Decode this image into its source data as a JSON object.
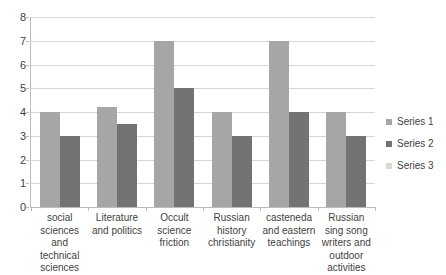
{
  "chart_data": {
    "type": "bar",
    "title": "",
    "subtitle": "",
    "xlabel": "",
    "ylabel": "",
    "ylim": [
      0,
      8
    ],
    "ytick_step": 1,
    "yticks": [
      "8",
      "7",
      "6",
      "5",
      "4",
      "3",
      "2",
      "1",
      "0"
    ],
    "grid": "horizontal",
    "legend_position": "right",
    "categories": [
      "social sciences and technical sciences",
      "Literature and politics",
      "Occult science friction",
      "Russian history christianity",
      "casteneda and eastern teachings",
      "Russian sing song writers and outdoor activities"
    ],
    "series": [
      {
        "name": "Series 1",
        "color": "#a6a6a6",
        "values": [
          4,
          4.2,
          7,
          4,
          7,
          4
        ]
      },
      {
        "name": "Series 2",
        "color": "#737373",
        "values": [
          3,
          3.5,
          5,
          3,
          4,
          3
        ]
      },
      {
        "name": "Series 3",
        "color": "#d9d9d9",
        "values": [
          0,
          0,
          0,
          0,
          0,
          0
        ]
      }
    ]
  },
  "legend": {
    "items": [
      {
        "label": "Series 1",
        "color": "#a6a6a6"
      },
      {
        "label": "Series 2",
        "color": "#737373"
      },
      {
        "label": "Series 3",
        "color": "#d9d9d9"
      }
    ]
  }
}
